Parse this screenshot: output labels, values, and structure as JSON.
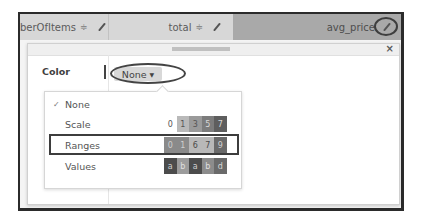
{
  "table": {
    "columns": [
      {
        "name": "numberOfItems",
        "visible_label": "berOfItems",
        "sort_icon": "sort-arrows-icon",
        "edit_icon": "pencil-icon"
      },
      {
        "name": "total",
        "visible_label": "total",
        "sort_icon": "sort-arrows-icon",
        "edit_icon": "pencil-icon"
      },
      {
        "name": "avg_price",
        "visible_label": "avg_price",
        "edit_icon": "pencil-icon",
        "active": true
      }
    ],
    "sort_glyph": "≑"
  },
  "modal": {
    "close_label": "×",
    "color_label": "Color",
    "dropdown": {
      "selected": "None",
      "caret": "▼"
    },
    "menu": {
      "items": [
        {
          "label": "None",
          "checked": true,
          "check_glyph": "✓",
          "swatches": []
        },
        {
          "label": "Scale",
          "swatches": [
            {
              "text": "0",
              "bg": "#ffffff",
              "fg": "#555555"
            },
            {
              "text": "1",
              "bg": "#b9b9b9",
              "fg": "#555555"
            },
            {
              "text": "3",
              "bg": "#9a9a9a",
              "fg": "#555555"
            },
            {
              "text": "5",
              "bg": "#7c7c7c",
              "fg": "#d8d8d8"
            },
            {
              "text": "7",
              "bg": "#5e5e5e",
              "fg": "#d8d8d8"
            }
          ]
        },
        {
          "label": "Ranges",
          "highlighted": true,
          "swatches": [
            {
              "text": "0",
              "bg": "#8a8a8a",
              "fg": "#cfcfcf"
            },
            {
              "text": "1",
              "bg": "#8a8a8a",
              "fg": "#cfcfcf"
            },
            {
              "text": "6",
              "bg": "#b8b8b8",
              "fg": "#4a4a4a"
            },
            {
              "text": "7",
              "bg": "#b8b8b8",
              "fg": "#4a4a4a"
            },
            {
              "text": "9",
              "bg": "#6a6a6a",
              "fg": "#d0d0d0"
            }
          ]
        },
        {
          "label": "Values",
          "swatches": [
            {
              "text": "a",
              "bg": "#4c4c4c",
              "fg": "#d0d0d0"
            },
            {
              "text": "b",
              "bg": "#9c9c9c",
              "fg": "#e0e0e0"
            },
            {
              "text": "a",
              "bg": "#4c4c4c",
              "fg": "#d0d0d0"
            },
            {
              "text": "b",
              "bg": "#8c8c8c",
              "fg": "#e0e0e0"
            },
            {
              "text": "d",
              "bg": "#6a6a6a",
              "fg": "#d8d8d8"
            }
          ]
        }
      ]
    }
  }
}
